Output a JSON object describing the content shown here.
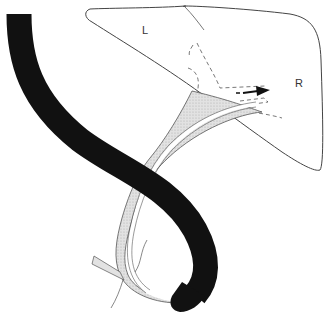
{
  "diagram": {
    "type": "anatomical-illustration",
    "labels": {
      "left_lobe": "L",
      "right_lobe": "R"
    },
    "elements": [
      {
        "name": "liver-outline",
        "description": "Liver outline with left (L) and right (R) lobes"
      },
      {
        "name": "endoscope",
        "description": "Black endoscope curving from top-left down and around to lower-right tip"
      },
      {
        "name": "bile-duct",
        "description": "Stippled bile duct running from liver hilum down to papilla"
      },
      {
        "name": "catheter",
        "description": "Thin catheter inside duct extending into right hepatic duct"
      },
      {
        "name": "direction-arrow",
        "description": "Arrow pointing right into right intrahepatic duct"
      },
      {
        "name": "intrahepatic-ducts",
        "description": "Dashed lines showing intrahepatic ducts"
      }
    ],
    "colors": {
      "scope": "#111111",
      "outline": "#333333",
      "duct_fill": "#d9d9d9"
    }
  }
}
